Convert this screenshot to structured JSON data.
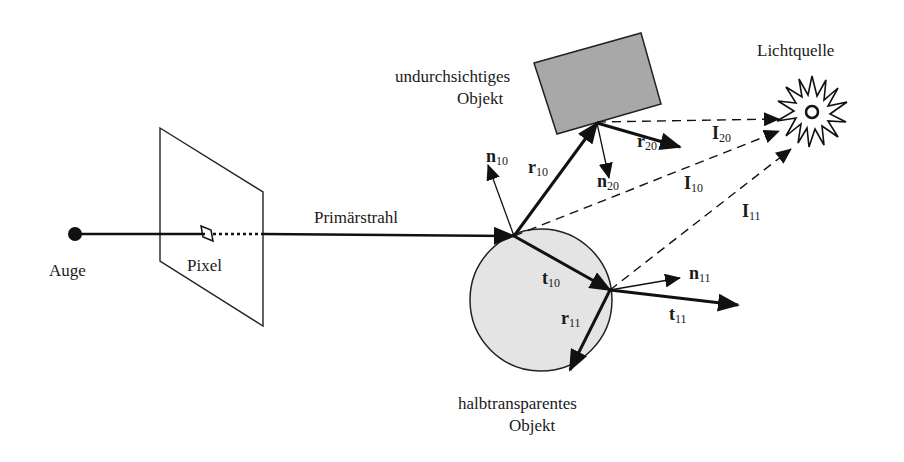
{
  "diagram": {
    "labels": {
      "eye": "Auge",
      "pixel": "Pixel",
      "primary_ray": "Primärstrahl",
      "opaque_object_line1": "undurchsichtiges",
      "opaque_object_line2": "Objekt",
      "light_source": "Lichtquelle",
      "transparent_object_line1": "halbtransparentes",
      "transparent_object_line2": "Objekt"
    },
    "vectors": {
      "n10": {
        "base": "n",
        "sub": "10"
      },
      "r10": {
        "base": "r",
        "sub": "10"
      },
      "n20": {
        "base": "n",
        "sub": "20"
      },
      "r20": {
        "base": "r",
        "sub": "20"
      },
      "I20": {
        "base": "I",
        "sub": "20"
      },
      "I10": {
        "base": "I",
        "sub": "10"
      },
      "I11": {
        "base": "I",
        "sub": "11"
      },
      "t10": {
        "base": "t",
        "sub": "10"
      },
      "n11": {
        "base": "n",
        "sub": "11"
      },
      "t11": {
        "base": "t",
        "sub": "11"
      },
      "r11": {
        "base": "r",
        "sub": "11"
      }
    },
    "colors": {
      "line": "#111111",
      "opaque_fill": "#a8a8a8",
      "transparent_fill": "#e4e4e4",
      "background": "#ffffff"
    }
  }
}
